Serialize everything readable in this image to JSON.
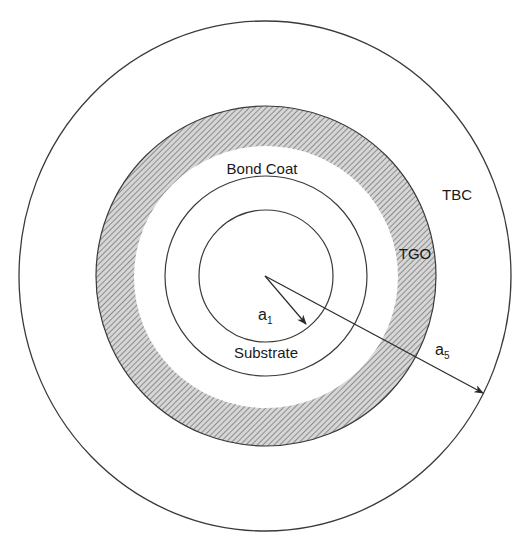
{
  "diagram": {
    "colors": {
      "line": "#3a3a3a",
      "hatch": "#8a8a8a",
      "text": "#1a1a1a",
      "background": "#ffffff"
    },
    "layers": [
      {
        "name": "Substrate",
        "label": "Substrate"
      },
      {
        "name": "Bond Coat",
        "label": "Bond Coat"
      },
      {
        "name": "TGO",
        "label": "TGO"
      },
      {
        "name": "TBC",
        "label": "TBC"
      }
    ],
    "labels": {
      "substrate": "Substrate",
      "bond_coat": "Bond Coat",
      "tgo": "TGO",
      "tbc": "TBC"
    },
    "radii": {
      "a1": {
        "base": "a",
        "sub": "1"
      },
      "a5": {
        "base": "a",
        "sub": "5"
      }
    }
  }
}
